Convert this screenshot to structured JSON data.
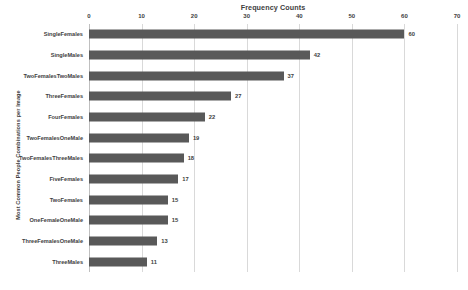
{
  "chart_data": {
    "type": "bar",
    "orientation": "horizontal",
    "title": "Frequency Counts",
    "xlabel": "",
    "ylabel": "Most Common People Combinations per Image",
    "xlim": [
      0,
      70
    ],
    "xticks": [
      0,
      10,
      20,
      30,
      40,
      50,
      60,
      70
    ],
    "xtick_labels": [
      "0",
      "10",
      "20",
      "30",
      "40",
      "50",
      "60",
      "70"
    ],
    "grid": "vertical",
    "legend": "none",
    "bar_color": "#595959",
    "categories": [
      "SingleFemales",
      "SingleMales",
      "TwoFemalesTwoMales",
      "ThreeFemales",
      "FourFemales",
      "TwoFemalesOneMale",
      "TwoFemalesThreeMales",
      "FiveFemales",
      "TwoFemales",
      "OneFemaleOneMale",
      "ThreeFemalesOneMale",
      "ThreeMales"
    ],
    "values": [
      60,
      42,
      37,
      27,
      22,
      19,
      18,
      17,
      15,
      15,
      13,
      11
    ],
    "value_labels": [
      "60",
      "42",
      "37",
      "27",
      "22",
      "19",
      "18",
      "17",
      "15",
      "15",
      "13",
      "11"
    ]
  }
}
